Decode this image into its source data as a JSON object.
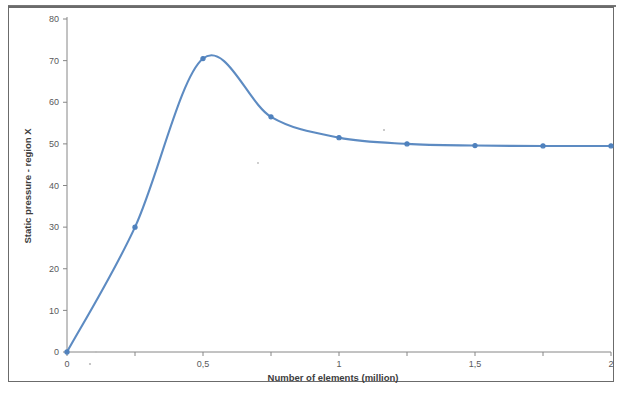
{
  "chart_data": {
    "type": "line",
    "title": "",
    "subtitle": "",
    "xlabel": "Number of elements (million)",
    "ylabel": "Static pressure - region X",
    "xlim": [
      0,
      2
    ],
    "ylim": [
      0,
      80
    ],
    "grid": false,
    "legend": null,
    "legend_position": "none",
    "line_color": "#4f81bd",
    "marker_color": "#4f81bd",
    "x_tick_labels": [
      "0",
      "0,5",
      "1",
      "1,5",
      "2"
    ],
    "x_tick_values": [
      0,
      0.5,
      1,
      1.5,
      2
    ],
    "x_minor_tick_values": [
      0,
      0.25,
      0.5,
      0.75,
      1,
      1.25,
      1.5,
      1.75,
      2
    ],
    "y_tick_labels": [
      "0",
      "10",
      "20",
      "30",
      "40",
      "50",
      "60",
      "70",
      "80"
    ],
    "y_tick_values": [
      0,
      10,
      20,
      30,
      40,
      50,
      60,
      70,
      80
    ],
    "x": [
      0,
      0.25,
      0.5,
      0.75,
      1,
      1.25,
      1.5,
      1.75,
      2
    ],
    "values": [
      0,
      30,
      70.5,
      56.5,
      51.5,
      50,
      49.6,
      49.5,
      49.5
    ],
    "series": [
      {
        "name": "Static pressure - region X",
        "x": [
          0,
          0.25,
          0.5,
          0.75,
          1,
          1.25,
          1.5,
          1.75,
          2
        ],
        "values": [
          0,
          30,
          70.5,
          56.5,
          51.5,
          50,
          49.6,
          49.5,
          49.5
        ]
      }
    ],
    "annotations": []
  }
}
